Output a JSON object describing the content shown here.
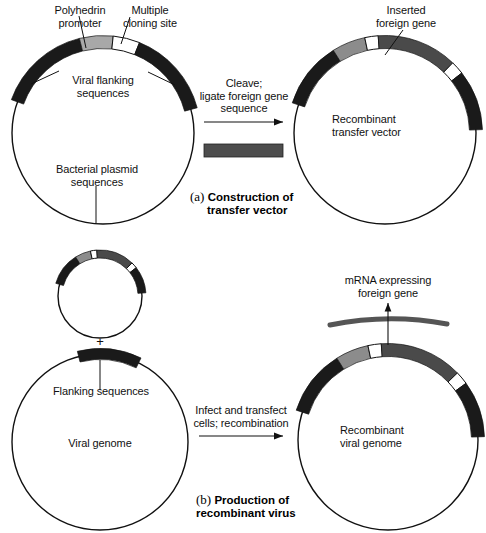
{
  "figure": {
    "title_a_marker": "(a)",
    "title_b_marker": "(b)"
  },
  "panel_a": {
    "caption_line1": "Construction of",
    "caption_line2": "transfer vector",
    "left_plasmid": {
      "labels": {
        "polyhedrin_l1": "Polyhedrin",
        "polyhedrin_l2": "promoter",
        "mcs_l1": "Multiple",
        "mcs_l2": "cloning site",
        "flanking_l1": "Viral flanking",
        "flanking_l2": "sequences",
        "interior_l1": "Bacterial plasmid",
        "interior_l2": "sequences"
      },
      "segments": [
        {
          "name": "viral-flanking-left",
          "color": "#1a1a1a",
          "start_deg": 200,
          "end_deg": 256
        },
        {
          "name": "polyhedrin-promoter",
          "color": "#a8a8a8",
          "start_deg": 256,
          "end_deg": 276
        },
        {
          "name": "multiple-cloning-site",
          "color": "#ffffff",
          "start_deg": 276,
          "end_deg": 292
        },
        {
          "name": "viral-flanking-right",
          "color": "#1a1a1a",
          "start_deg": 292,
          "end_deg": 345
        }
      ]
    },
    "arrow_step": {
      "line1": "Cleave;",
      "line2": "ligate foreign gene",
      "line3": "sequence"
    },
    "fragment": {
      "name": "foreign-gene-fragment",
      "color": "#4d4d4d"
    },
    "right_plasmid": {
      "labels": {
        "inserted_l1": "Inserted",
        "inserted_l2": "foreign gene",
        "interior_l1": "Recombinant",
        "interior_l2": "transfer vector"
      },
      "segments": [
        {
          "name": "viral-flanking-left",
          "color": "#1a1a1a",
          "start_deg": 198,
          "end_deg": 238
        },
        {
          "name": "polyhedrin-promoter",
          "color": "#8c8c8c",
          "start_deg": 238,
          "end_deg": 258
        },
        {
          "name": "cloning-junction-left",
          "color": "#ffffff",
          "start_deg": 258,
          "end_deg": 266
        },
        {
          "name": "inserted-foreign-gene",
          "color": "#4a4a4a",
          "start_deg": 266,
          "end_deg": 314
        },
        {
          "name": "cloning-junction-right",
          "color": "#ffffff",
          "start_deg": 314,
          "end_deg": 322
        },
        {
          "name": "viral-flanking-right",
          "color": "#1a1a1a",
          "start_deg": 322,
          "end_deg": 358
        }
      ]
    }
  },
  "panel_b": {
    "caption_line1": "Production of",
    "caption_line2": "recombinant virus",
    "plus_sign": "+",
    "small_plasmid": {
      "segments": [
        {
          "name": "viral-flanking-left",
          "color": "#1a1a1a",
          "start_deg": 196,
          "end_deg": 238
        },
        {
          "name": "polyhedrin-promoter",
          "color": "#8c8c8c",
          "start_deg": 238,
          "end_deg": 258
        },
        {
          "name": "cloning-junction-left",
          "color": "#ffffff",
          "start_deg": 258,
          "end_deg": 266
        },
        {
          "name": "inserted-foreign-gene",
          "color": "#4a4a4a",
          "start_deg": 266,
          "end_deg": 314
        },
        {
          "name": "cloning-junction-right",
          "color": "#ffffff",
          "start_deg": 314,
          "end_deg": 322
        },
        {
          "name": "viral-flanking-right",
          "color": "#1a1a1a",
          "start_deg": 322,
          "end_deg": 356
        }
      ]
    },
    "viral_genome": {
      "labels": {
        "flanking": "Flanking sequences",
        "interior": "Viral genome"
      },
      "segments": [
        {
          "name": "flanking-sequences",
          "color": "#1a1a1a",
          "start_deg": 256,
          "end_deg": 296
        }
      ]
    },
    "arrow_step": {
      "line1": "Infect and transfect",
      "line2": "cells; recombination"
    },
    "recombinant_genome": {
      "labels": {
        "mrna_l1": "mRNA expressing",
        "mrna_l2": "foreign gene",
        "interior_l1": "Recombinant",
        "interior_l2": "viral genome"
      },
      "mrna": {
        "name": "mrna-arc",
        "color": "#555555"
      },
      "segments": [
        {
          "name": "viral-flanking-left",
          "color": "#1a1a1a",
          "start_deg": 198,
          "end_deg": 238
        },
        {
          "name": "polyhedrin-promoter",
          "color": "#8c8c8c",
          "start_deg": 238,
          "end_deg": 258
        },
        {
          "name": "cloning-junction-left",
          "color": "#ffffff",
          "start_deg": 258,
          "end_deg": 266
        },
        {
          "name": "inserted-foreign-gene",
          "color": "#4a4a4a",
          "start_deg": 266,
          "end_deg": 316
        },
        {
          "name": "cloning-junction-right",
          "color": "#ffffff",
          "start_deg": 316,
          "end_deg": 324
        },
        {
          "name": "viral-flanking-right",
          "color": "#1a1a1a",
          "start_deg": 324,
          "end_deg": 358
        }
      ]
    }
  },
  "colors": {
    "outline": "#111111",
    "black_segment": "#1a1a1a",
    "light_gray_segment": "#a8a8a8",
    "mid_gray_segment": "#8c8c8c",
    "dark_gray_segment": "#4a4a4a",
    "white_segment": "#ffffff"
  }
}
